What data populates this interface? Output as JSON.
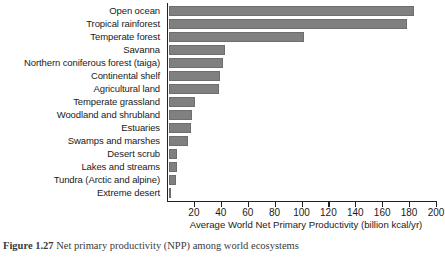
{
  "chart_data": {
    "type": "bar",
    "orientation": "horizontal",
    "title": "",
    "xlabel": "Average World Net Primary Productivity (billion kcal/yr)",
    "ylabel": "",
    "xlim": [
      0,
      200
    ],
    "xticks": [
      20,
      40,
      60,
      80,
      100,
      120,
      140,
      160,
      180,
      200
    ],
    "grid": false,
    "legend": null,
    "bar_color": "#808080",
    "axis_color": "#222222",
    "categories": [
      "Open ocean",
      "Tropical rainforest",
      "Temperate forest",
      "Savanna",
      "Northern coniferous forest (taiga)",
      "Continental shelf",
      "Agricultural land",
      "Temperate grassland",
      "Woodland and shrubland",
      "Estuaries",
      "Swamps and marshes",
      "Desert scrub",
      "Lakes and streams",
      "Tundra (Arctic and alpine)",
      "Extreme desert"
    ],
    "values": [
      182,
      177,
      100,
      42,
      40,
      38,
      37,
      19,
      17,
      16,
      14,
      6,
      6,
      5,
      1.5
    ]
  },
  "caption": {
    "figure_number": "Figure 1.27",
    "text": "Net primary productivity (NPP) among world ecosystems"
  }
}
